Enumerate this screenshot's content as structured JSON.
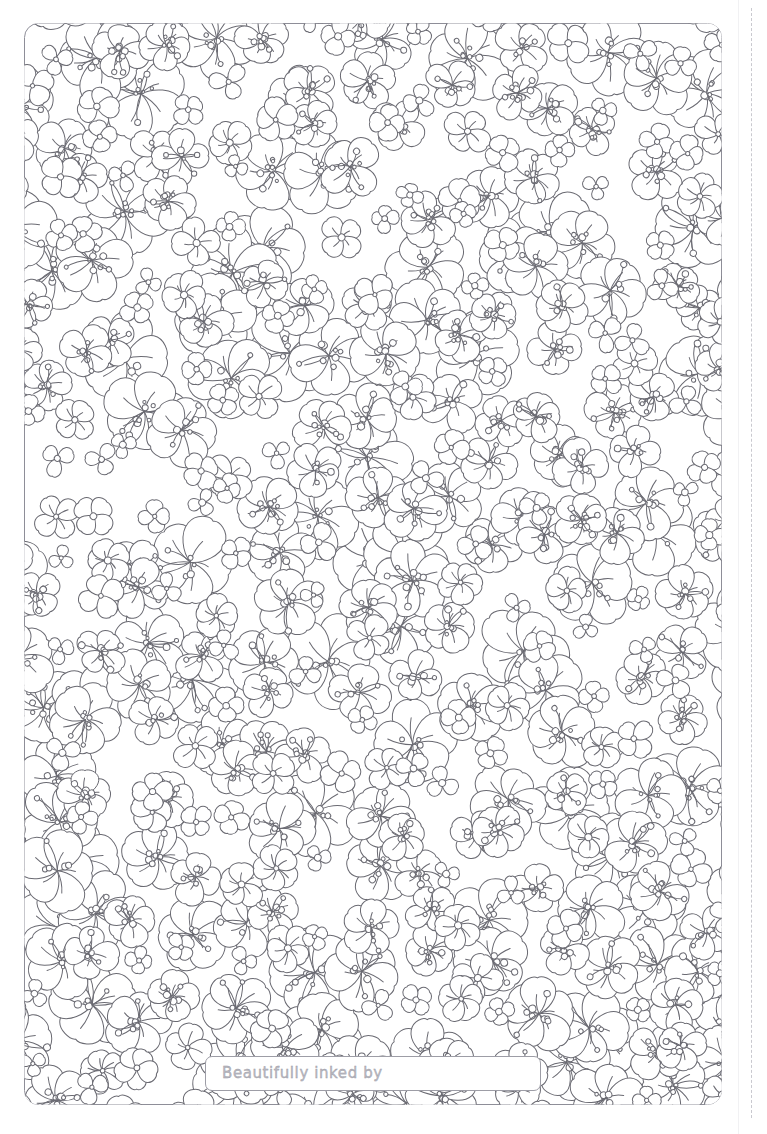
{
  "page": {
    "width": 767,
    "height": 1134,
    "background_color": "#ffffff",
    "type": "coloring-page"
  },
  "frame": {
    "name": "artwork-frame",
    "x": 24,
    "y": 23,
    "width": 698,
    "height": 1082,
    "corner_radius": 14,
    "stroke_color": "#8e8e98",
    "stroke_width": 1,
    "fill_color": "#ffffff"
  },
  "pattern": {
    "motif": "flower-outline",
    "line_color": "#6a6a72",
    "line_width": 1,
    "fill_color": "#ffffff",
    "petal_counts": [
      3,
      4,
      5
    ],
    "size_classes": [
      "small",
      "medium",
      "large"
    ],
    "density": "dense",
    "rotation": "random",
    "center_detail": "cluster of small circles (stamens) with thin stem lines"
  },
  "trim_guides": [
    {
      "name": "trim-line-solid",
      "x": 738,
      "style": "solid",
      "color": "#f1f1f3"
    },
    {
      "name": "trim-line-dashed",
      "x": 751,
      "style": "dashed",
      "color": "#c9c9cf"
    }
  ],
  "label": {
    "name": "signature-label",
    "text": "Beautifully inked by",
    "x": 205,
    "y": 1056,
    "width": 336,
    "height": 35,
    "border_color": "#9d9da6",
    "text_color": "#b9b9c2",
    "fill_color": "#ffffff"
  }
}
